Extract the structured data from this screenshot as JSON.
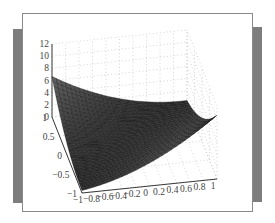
{
  "chart_data": {
    "type": "surface3d",
    "title": "",
    "xlabel": "",
    "ylabel": "",
    "zlabel": "",
    "x_ticks": [
      "−1",
      "−0.8",
      "−0.6",
      "−0.4",
      "−0.2",
      "0",
      "0.2",
      "0.4",
      "0.6",
      "0.8",
      "1"
    ],
    "y_ticks": [
      "−1",
      "−0.5",
      "0",
      "0.5",
      "1"
    ],
    "z_ticks": [
      "0",
      "2",
      "4",
      "6",
      "8",
      "10",
      "12"
    ],
    "xlim": [
      -1,
      1
    ],
    "ylim": [
      -1,
      1
    ],
    "zlim": [
      0,
      12
    ],
    "grid": true,
    "grid_style": "dotted",
    "mesh_resolution": 30,
    "surface_color": "#3a3a3a",
    "mesh_line_color": "#111111",
    "approx_surface": "z = 2.5*(x - y)^2 + 0.6*(1 - x)^2 ... peak ≈10 at (x=-1,y=1), trough along x≈y"
  },
  "frame": {
    "panel_border_color": "#8a8a8a",
    "side_bar_color": "#7d7d7d"
  }
}
